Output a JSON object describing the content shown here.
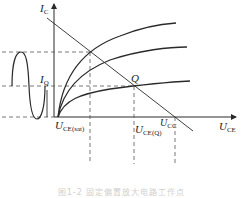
{
  "diagram": {
    "type": "transistor output characteristics with load line",
    "axes": {
      "y_label_main": "I",
      "y_label_sub": "C",
      "x_label_main": "U",
      "x_label_sub": "CE"
    },
    "labels": {
      "iq_main": "I",
      "iq_sub": "Q",
      "q_point": "Q",
      "ucesat_main": "U",
      "ucesat_sub": "CE(sat)",
      "uceq_main": "U",
      "uceq_sub": "CE(Q)",
      "ucc_main": "U",
      "ucc_sub": "CC"
    },
    "caption": "图1-2 固定偏置放大电路工作点",
    "colors": {
      "line": "#2a2a2a",
      "dashed": "#555555",
      "caption": "#d0d0d0"
    }
  }
}
